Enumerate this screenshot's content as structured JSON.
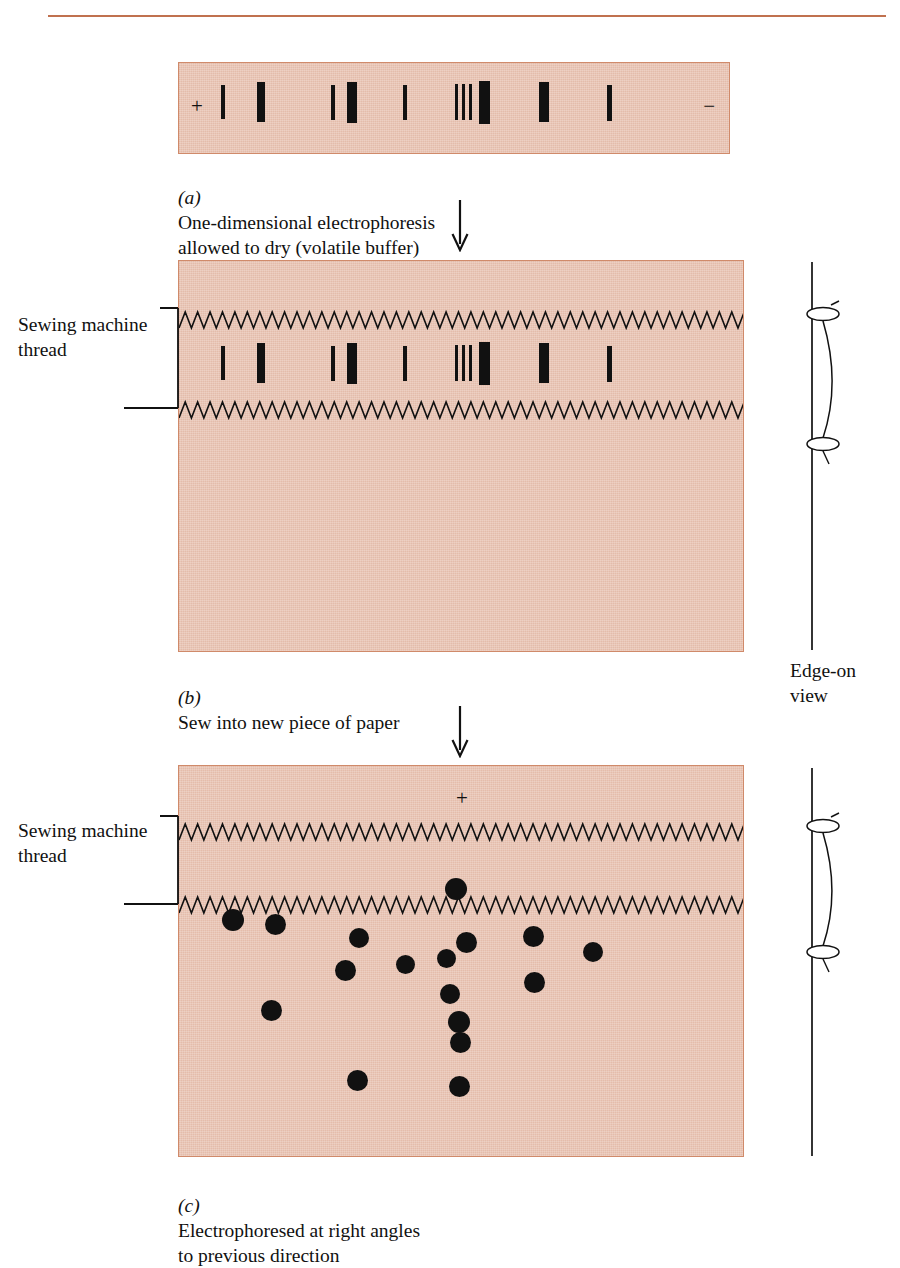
{
  "figure": {
    "paper_color": "#e9c6b6",
    "paper_border_color": "#d08a6a",
    "ink_color": "#111111",
    "rule_color": "#c0714f"
  },
  "panel_a": {
    "label": "(a)",
    "caption": "One-dimensional electrophoresis\nallowed to dry (volatile buffer)",
    "anode_sign": "+",
    "cathode_sign": "−",
    "bands": [
      {
        "x": 42,
        "y": 22,
        "w": 3.5,
        "h": 34
      },
      {
        "x": 78,
        "y": 19,
        "w": 8,
        "h": 40
      },
      {
        "x": 152,
        "y": 22,
        "w": 4,
        "h": 35
      },
      {
        "x": 168,
        "y": 19,
        "w": 10,
        "h": 41
      },
      {
        "x": 224,
        "y": 22,
        "w": 4,
        "h": 35
      },
      {
        "x": 276,
        "y": 21,
        "w": 3,
        "h": 36
      },
      {
        "x": 283,
        "y": 21,
        "w": 3,
        "h": 36
      },
      {
        "x": 290,
        "y": 21,
        "w": 3,
        "h": 36
      },
      {
        "x": 300,
        "y": 18,
        "w": 11,
        "h": 43
      },
      {
        "x": 360,
        "y": 19,
        "w": 10,
        "h": 40
      },
      {
        "x": 428,
        "y": 22,
        "w": 5,
        "h": 36
      }
    ]
  },
  "panel_b": {
    "label": "(b)",
    "caption": "Sew into new piece of paper",
    "thread_label": "Sewing\nmachine\nthread",
    "stitch_rows_y": [
      48,
      138
    ],
    "bands": [
      {
        "x": 42,
        "y": 85,
        "w": 3.5,
        "h": 34
      },
      {
        "x": 78,
        "y": 82,
        "w": 8,
        "h": 40
      },
      {
        "x": 152,
        "y": 85,
        "w": 4,
        "h": 35
      },
      {
        "x": 168,
        "y": 82,
        "w": 10,
        "h": 41
      },
      {
        "x": 224,
        "y": 85,
        "w": 4,
        "h": 35
      },
      {
        "x": 276,
        "y": 84,
        "w": 3,
        "h": 36
      },
      {
        "x": 283,
        "y": 84,
        "w": 3,
        "h": 36
      },
      {
        "x": 290,
        "y": 84,
        "w": 3,
        "h": 36
      },
      {
        "x": 300,
        "y": 81,
        "w": 11,
        "h": 43
      },
      {
        "x": 360,
        "y": 82,
        "w": 10,
        "h": 40
      },
      {
        "x": 428,
        "y": 85,
        "w": 5,
        "h": 36
      }
    ]
  },
  "panel_c": {
    "label": "(c)",
    "caption": "Electrophoresed at right angles\nto previous direction",
    "thread_label": "Sewing\nmachine\nthread",
    "anode_sign": "+",
    "anode_sign_x": 277,
    "anode_sign_y": 22,
    "stitch_rows_y": [
      55,
      128
    ],
    "spots": [
      {
        "x": 54,
        "y": 154,
        "r": 11
      },
      {
        "x": 96,
        "y": 158,
        "r": 10.5
      },
      {
        "x": 180,
        "y": 172,
        "r": 10
      },
      {
        "x": 166,
        "y": 204,
        "r": 10.5
      },
      {
        "x": 226,
        "y": 198,
        "r": 9.5
      },
      {
        "x": 267,
        "y": 192,
        "r": 9.5
      },
      {
        "x": 287,
        "y": 176,
        "r": 10.5
      },
      {
        "x": 277,
        "y": 123,
        "r": 11
      },
      {
        "x": 271,
        "y": 228,
        "r": 10
      },
      {
        "x": 280,
        "y": 256,
        "r": 11
      },
      {
        "x": 281,
        "y": 276,
        "r": 10.5
      },
      {
        "x": 354,
        "y": 170,
        "r": 10.5
      },
      {
        "x": 355,
        "y": 216,
        "r": 10.5
      },
      {
        "x": 414,
        "y": 186,
        "r": 10
      },
      {
        "x": 92,
        "y": 244,
        "r": 10.5
      },
      {
        "x": 178,
        "y": 314,
        "r": 10.5
      },
      {
        "x": 280,
        "y": 320,
        "r": 10.5
      }
    ]
  },
  "edge_on": {
    "caption": "Edge-on\nview"
  }
}
